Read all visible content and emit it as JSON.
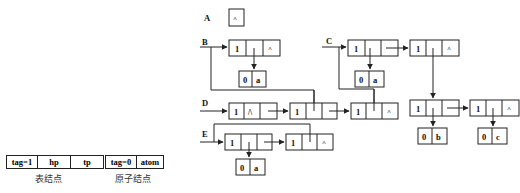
{
  "legend": {
    "list_node": {
      "cells": [
        "tag=1",
        "hp",
        "tp"
      ],
      "caption": "表结点"
    },
    "atom_node": {
      "cells": [
        "tag=0",
        "atom"
      ],
      "caption": "原子结点"
    }
  },
  "lists": {
    "A": {
      "label": "A",
      "value": "^"
    },
    "B": {
      "label": "B",
      "node": {
        "tag": "1",
        "tp": "^"
      },
      "atom": {
        "tag": "0",
        "value": "a"
      }
    },
    "C": {
      "label": "C",
      "n1": {
        "tag": "1"
      },
      "n2": {
        "tag": "1",
        "tp": "^"
      },
      "atom_a": {
        "tag": "0",
        "value": "a"
      },
      "n3": {
        "tag": "1"
      },
      "n4": {
        "tag": "1",
        "tp": "^"
      },
      "atom_b": {
        "tag": "0",
        "value": "b"
      },
      "atom_c": {
        "tag": "0",
        "value": "c"
      }
    },
    "D": {
      "label": "D",
      "n1": {
        "tag": "1",
        "hp": "/\\"
      },
      "n2": {
        "tag": "1"
      },
      "n3": {
        "tag": "1",
        "tp": "^"
      }
    },
    "E": {
      "label": "E",
      "n1": {
        "tag": "1"
      },
      "n2": {
        "tag": "1",
        "tp": "^"
      },
      "atom": {
        "tag": "0",
        "value": "a"
      }
    }
  },
  "colors": {
    "line": "#222222",
    "text": "#111111",
    "background": "#ffffff"
  }
}
